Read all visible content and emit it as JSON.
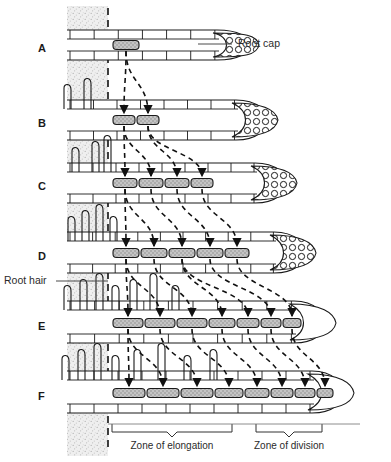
{
  "figure": {
    "type": "biological-diagram",
    "width": 391,
    "height": 462,
    "background_color": "#ffffff",
    "ink_color": "#1a1a1a",
    "soil_color": "#ebebeb",
    "marked_cell_fill": "#b9b9b9"
  },
  "annotations": {
    "root_cap_label": "Root cap",
    "root_hair_label": "Root hair"
  },
  "zones": [
    {
      "id": "elongation",
      "label": "Zone of elongation",
      "x_start": 112,
      "x_end": 232,
      "label_x": 172,
      "label_y": 446
    },
    {
      "id": "division",
      "label": "Zone of division",
      "x_start": 256,
      "x_end": 322,
      "label_x": 289,
      "label_y": 446
    }
  ],
  "soil_band": {
    "x": 67,
    "width": 41,
    "reference_line_x": 108
  },
  "rows": [
    {
      "letter": "A",
      "letter_x": 38,
      "letter_y": 49,
      "baseline_y": 45,
      "upper_cells_y": 30,
      "lower_cells_y": 60,
      "tip_x": 243,
      "root_cap_shaded": true,
      "root_hairs": [],
      "marked_cells": [
        {
          "x": 113,
          "w": 26
        }
      ],
      "arrow_count": 0
    },
    {
      "letter": "B",
      "letter_x": 38,
      "letter_y": 124,
      "baseline_y": 120,
      "upper_cells_y": 100,
      "lower_cells_y": 140,
      "tip_x": 262,
      "root_cap_shaded": true,
      "root_hairs": [
        64,
        84
      ],
      "marked_cells": [
        {
          "x": 113,
          "w": 22
        },
        {
          "x": 137,
          "w": 22
        }
      ],
      "arrow_count": 2
    },
    {
      "letter": "C",
      "letter_x": 38,
      "letter_y": 187,
      "baseline_y": 183,
      "upper_cells_y": 163,
      "lower_cells_y": 203,
      "tip_x": 281,
      "root_cap_shaded": true,
      "root_hairs": [
        72,
        92,
        104
      ],
      "marked_cells": [
        {
          "x": 113,
          "w": 24
        },
        {
          "x": 139,
          "w": 24
        },
        {
          "x": 165,
          "w": 24
        },
        {
          "x": 191,
          "w": 22
        }
      ],
      "arrow_count": 4
    },
    {
      "letter": "D",
      "letter_x": 38,
      "letter_y": 257,
      "baseline_y": 253,
      "upper_cells_y": 232,
      "lower_cells_y": 273,
      "tip_x": 300,
      "root_cap_shaded": true,
      "root_hairs": [
        68,
        82,
        96,
        110
      ],
      "marked_cells": [
        {
          "x": 113,
          "w": 26
        },
        {
          "x": 141,
          "w": 26
        },
        {
          "x": 169,
          "w": 26
        },
        {
          "x": 197,
          "w": 26
        },
        {
          "x": 225,
          "w": 24
        }
      ],
      "arrow_count": 5
    },
    {
      "letter": "E",
      "letter_x": 38,
      "letter_y": 327,
      "baseline_y": 323,
      "upper_cells_y": 301,
      "lower_cells_y": 343,
      "tip_x": 320,
      "root_cap_shaded": false,
      "root_hairs": [
        64,
        80,
        96,
        112,
        130,
        150,
        172
      ],
      "marked_cells": [
        {
          "x": 113,
          "w": 30
        },
        {
          "x": 145,
          "w": 30
        },
        {
          "x": 177,
          "w": 30
        },
        {
          "x": 209,
          "w": 26
        },
        {
          "x": 237,
          "w": 22
        },
        {
          "x": 261,
          "w": 20
        },
        {
          "x": 283,
          "w": 18
        }
      ],
      "arrow_count": 7
    },
    {
      "letter": "F",
      "letter_x": 38,
      "letter_y": 397,
      "baseline_y": 393,
      "upper_cells_y": 371,
      "lower_cells_y": 413,
      "tip_x": 338,
      "root_cap_shaded": false,
      "root_hairs": [
        62,
        78,
        94,
        112,
        134,
        158,
        184,
        210
      ],
      "marked_cells": [
        {
          "x": 113,
          "w": 32
        },
        {
          "x": 147,
          "w": 32
        },
        {
          "x": 181,
          "w": 32
        },
        {
          "x": 215,
          "w": 28
        },
        {
          "x": 245,
          "w": 24
        },
        {
          "x": 271,
          "w": 22
        },
        {
          "x": 295,
          "w": 20
        },
        {
          "x": 317,
          "w": 16
        }
      ],
      "arrow_count": 8
    }
  ],
  "callouts": [
    {
      "id": "root-cap",
      "text": "Root cap",
      "text_x": 238,
      "text_y": 44,
      "leader_from_x": 232,
      "leader_from_y": 44,
      "leader_to_x": 198,
      "leader_to_y": 44
    },
    {
      "id": "root-hair",
      "text": "Root hair",
      "text_x": 4,
      "text_y": 281,
      "leader_from_x": 56,
      "leader_from_y": 281,
      "leader_to_x": 108,
      "leader_to_y": 281
    }
  ]
}
